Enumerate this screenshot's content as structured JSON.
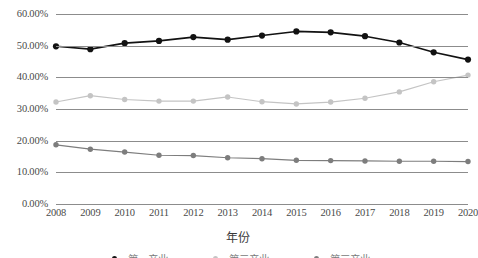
{
  "chart_data": {
    "type": "line",
    "title": "",
    "xlabel": "年份",
    "ylabel": "",
    "categories": [
      "2008",
      "2009",
      "2010",
      "2011",
      "2012",
      "2013",
      "2014",
      "2015",
      "2016",
      "2017",
      "2018",
      "2019",
      "2020"
    ],
    "x": [
      2008,
      2009,
      2010,
      2011,
      2012,
      2013,
      2014,
      2015,
      2016,
      2017,
      2018,
      2019,
      2020
    ],
    "ylim": [
      0,
      60
    ],
    "ytick_labels": [
      "0.00%",
      "10.00%",
      "20.00%",
      "30.00%",
      "40.00%",
      "50.00%",
      "60.00%"
    ],
    "ytick_values": [
      0,
      10,
      20,
      30,
      40,
      50,
      60
    ],
    "grid": true,
    "legend_position": "bottom",
    "series": [
      {
        "name": "第一产业",
        "color": "#121212",
        "marker": "circle",
        "values": [
          49.8,
          48.9,
          50.8,
          51.5,
          52.7,
          51.9,
          53.2,
          54.5,
          54.2,
          53.0,
          51.0,
          47.9,
          45.6
        ]
      },
      {
        "name": "第二产业",
        "color": "#c4c4c4",
        "marker": "circle",
        "values": [
          32.2,
          34.2,
          33.0,
          32.5,
          32.5,
          33.8,
          32.3,
          31.6,
          32.2,
          33.4,
          35.4,
          38.6,
          40.7
        ]
      },
      {
        "name": "第三产业",
        "color": "#7d7d7d",
        "marker": "circle",
        "values": [
          18.7,
          17.3,
          16.4,
          15.4,
          15.3,
          14.6,
          14.3,
          13.8,
          13.7,
          13.6,
          13.5,
          13.5,
          13.4
        ]
      }
    ]
  },
  "axis": {
    "x_title": "年份"
  }
}
